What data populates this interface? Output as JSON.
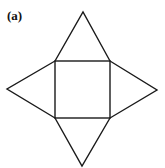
{
  "figure": {
    "label": "(a)",
    "stroke_color": "#1a1a1a",
    "square": {
      "x1": 55,
      "y1": 61,
      "x2": 110,
      "y2": 118
    },
    "apexes": {
      "top": [
        83,
        12
      ],
      "right": [
        157,
        90
      ],
      "bottom": [
        82,
        166
      ],
      "left": [
        7,
        89
      ]
    }
  }
}
